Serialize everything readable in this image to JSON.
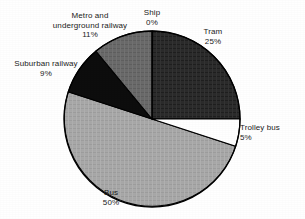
{
  "chart_data": {
    "type": "pie",
    "title": "",
    "subtitle": "",
    "xlabel": "",
    "ylabel": "",
    "legend_position": "none",
    "grid": false,
    "label_format": "name above percent, placed outside slices",
    "start_angle_deg": 0,
    "direction": "clockwise",
    "center": {
      "x": 152,
      "y": 119
    },
    "radius": 88,
    "categories": [
      "Ship",
      "Tram",
      "Trolley bus",
      "Bus",
      "Suburban railway",
      "Metro and underground railway"
    ],
    "values": [
      0,
      25,
      5,
      50,
      9,
      11
    ],
    "slices": [
      {
        "name": "Ship",
        "percent_label": "0%",
        "value": 0,
        "start_deg": 0,
        "end_deg": 0.4,
        "color": "#ffffff",
        "stroke": "#000000"
      },
      {
        "name": "Tram",
        "percent_label": "25%",
        "value": 25,
        "start_deg": 0.4,
        "end_deg": 90,
        "color": "#2b2b2b",
        "stroke": "#000000"
      },
      {
        "name": "Trolley bus",
        "percent_label": "5%",
        "value": 5,
        "start_deg": 90,
        "end_deg": 108,
        "color": "#ffffff",
        "stroke": "#000000"
      },
      {
        "name": "Bus",
        "percent_label": "50%",
        "value": 50,
        "start_deg": 108,
        "end_deg": 288,
        "color": "#a8a8a8",
        "stroke": "#000000"
      },
      {
        "name": "Suburban railway",
        "percent_label": "9%",
        "value": 9,
        "start_deg": 288,
        "end_deg": 320.4,
        "color": "#0d0d0d",
        "stroke": "#000000"
      },
      {
        "name": "Metro and underground railway",
        "percent_label": "11%",
        "value": 11,
        "start_deg": 320.4,
        "end_deg": 360,
        "color": "#6a6a6a",
        "stroke": "#000000"
      }
    ]
  },
  "labels": {
    "ship": {
      "name": "Ship",
      "percent": "0%"
    },
    "tram": {
      "name": "Tram",
      "percent": "25%"
    },
    "trolleybus": {
      "name": "Trolley bus",
      "percent": "5%"
    },
    "bus": {
      "name": "Bus",
      "percent": "50%"
    },
    "suburban": {
      "name": "Suburban railway",
      "percent": "9%"
    },
    "metro": {
      "name_line1": "Metro and",
      "name_line2": "underground railway",
      "percent": "11%"
    }
  },
  "colors": {
    "background": "#ffffff",
    "outline": "#000000",
    "tram": "#2b2b2b",
    "bus": "#a8a8a8",
    "metro": "#6a6a6a",
    "suburban": "#0d0d0d",
    "trolleybus": "#ffffff",
    "ship": "#ffffff",
    "text": "#1a1a1a"
  }
}
